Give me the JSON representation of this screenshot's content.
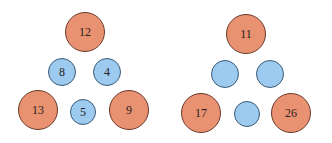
{
  "figures": [
    {
      "name": "left-triangle",
      "nodes": [
        {
          "role": "top",
          "color": "red",
          "value": "12",
          "cx": 85,
          "cy": 32,
          "r": 20
        },
        {
          "role": "mid-left",
          "color": "blue",
          "value": "8",
          "cx": 62,
          "cy": 72,
          "r": 14
        },
        {
          "role": "mid-right",
          "color": "blue",
          "value": "4",
          "cx": 107,
          "cy": 72,
          "r": 14
        },
        {
          "role": "bottom-left",
          "color": "red",
          "value": "13",
          "cx": 38,
          "cy": 110,
          "r": 20
        },
        {
          "role": "bottom-middle",
          "color": "blue",
          "value": "5",
          "cx": 83,
          "cy": 112,
          "r": 13
        },
        {
          "role": "bottom-right",
          "color": "red",
          "value": "9",
          "cx": 129,
          "cy": 110,
          "r": 20
        }
      ]
    },
    {
      "name": "right-triangle",
      "nodes": [
        {
          "role": "top",
          "color": "red",
          "value": "11",
          "cx": 246,
          "cy": 34,
          "r": 20
        },
        {
          "role": "mid-left",
          "color": "blue",
          "value": "",
          "cx": 225,
          "cy": 74,
          "r": 14
        },
        {
          "role": "mid-right",
          "color": "blue",
          "value": "",
          "cx": 270,
          "cy": 74,
          "r": 14
        },
        {
          "role": "bottom-left",
          "color": "red",
          "value": "17",
          "cx": 201,
          "cy": 113,
          "r": 20
        },
        {
          "role": "bottom-middle",
          "color": "blue",
          "value": "",
          "cx": 247,
          "cy": 114,
          "r": 13
        },
        {
          "role": "bottom-right",
          "color": "red",
          "value": "26",
          "cx": 291,
          "cy": 113,
          "r": 20
        }
      ]
    }
  ],
  "colors": {
    "red": "#e99272",
    "blue": "#9ccbef"
  }
}
